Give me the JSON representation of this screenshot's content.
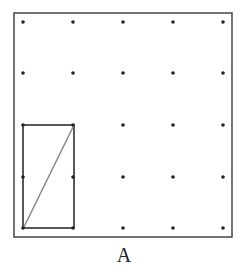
{
  "diagram": {
    "label": "A",
    "frame": {
      "x": 14,
      "y": 13,
      "w": 218,
      "h": 224,
      "stroke": "#444444"
    },
    "grid": {
      "xs": [
        23,
        73,
        123,
        173,
        223
      ],
      "ys": [
        22,
        73,
        125,
        177,
        228
      ],
      "dot_color": "#222222"
    },
    "rectangle": {
      "x1": 23,
      "y1": 125,
      "x2": 74,
      "y2": 228,
      "stroke": "#222222"
    },
    "diagonal": {
      "x1": 23,
      "y1": 229,
      "x2": 74,
      "y2": 125,
      "stroke": "#888888"
    }
  }
}
